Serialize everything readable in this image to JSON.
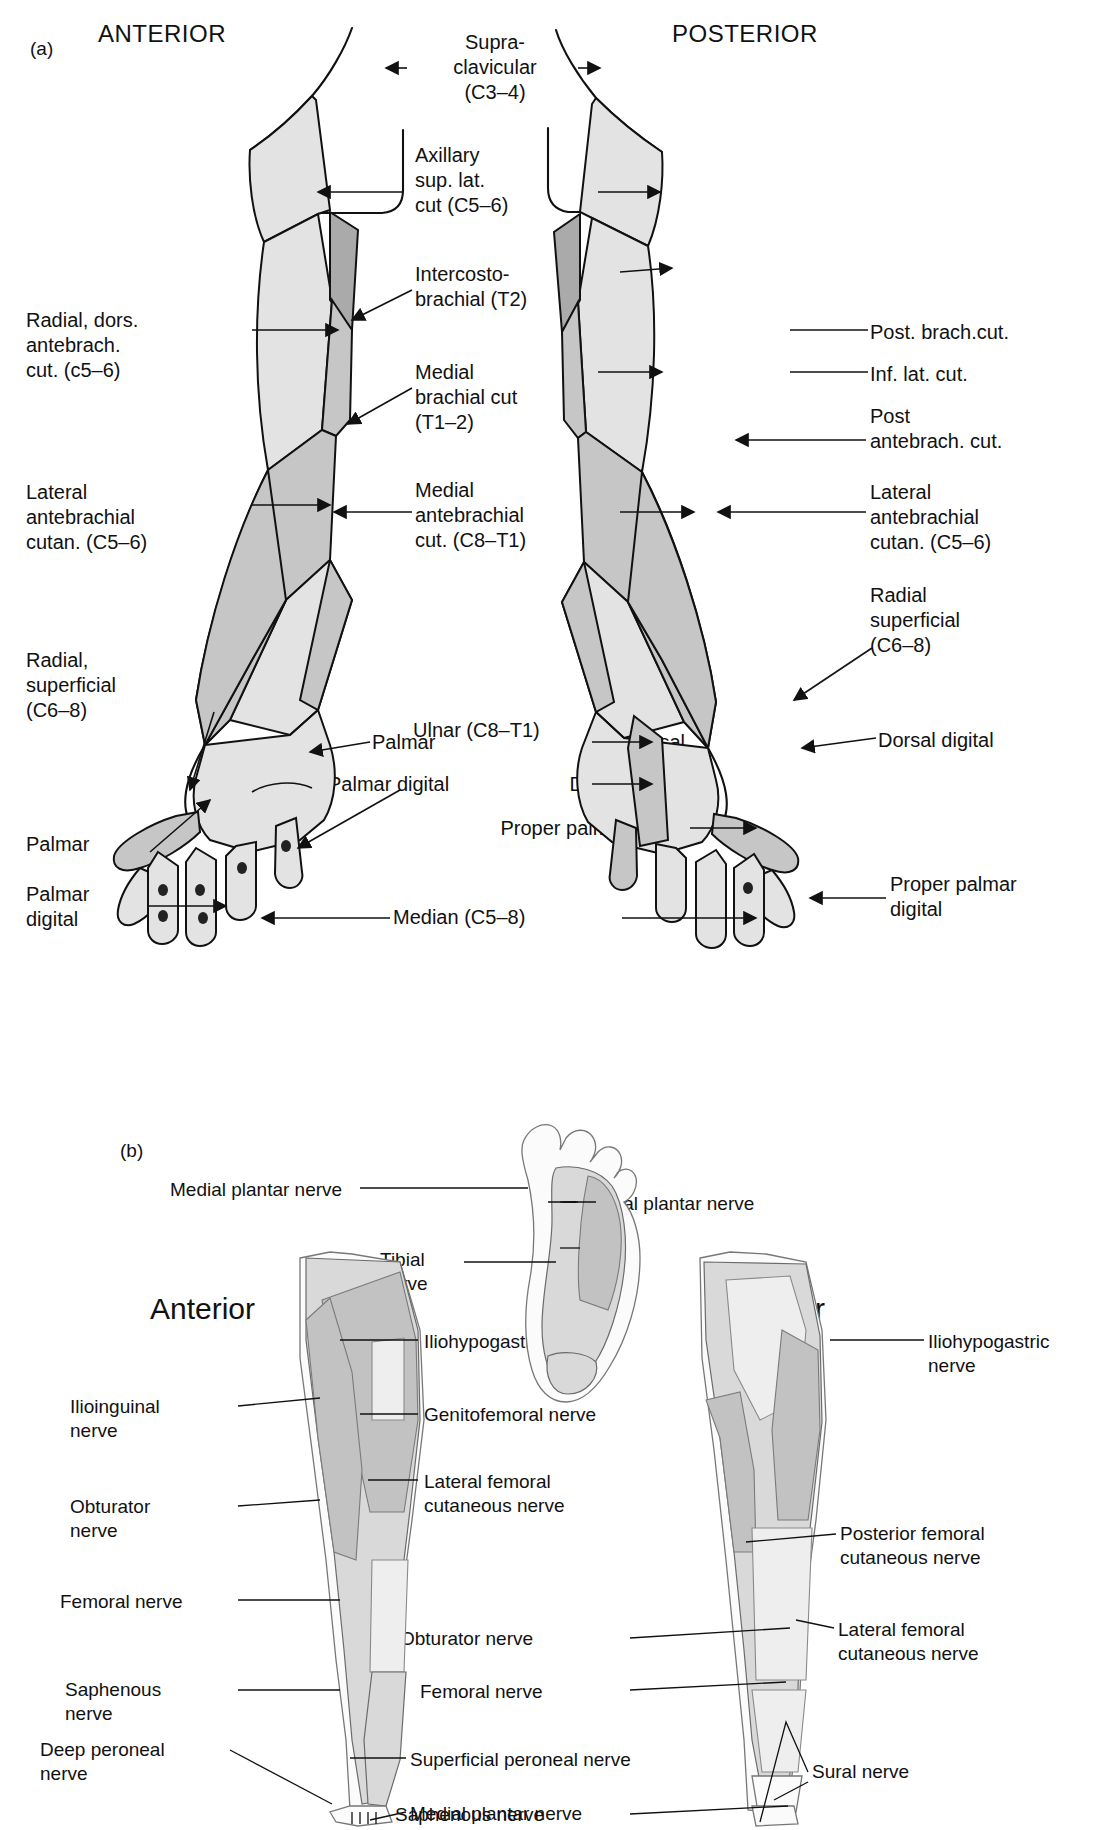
{
  "panel_a": {
    "caption": "(a)",
    "heading_left": "ANTERIOR",
    "heading_right": "POSTERIOR",
    "center_labels": [
      {
        "id": "supraclavicular",
        "text": "Supra-\nclavicular\n(C3–4)"
      },
      {
        "id": "axillary",
        "text": "Axillary\nsup. lat.\ncut (C5–6)"
      },
      {
        "id": "intercostobrachial",
        "text": "Intercosto-\nbrachial (T2)"
      },
      {
        "id": "medial-brachial-cut",
        "text": "Medial\nbrachial cut\n(T1–2)"
      },
      {
        "id": "medial-antebrachial-cut",
        "text": "Medial\nantebrachial\ncut. (C8–T1)"
      },
      {
        "id": "ulnar",
        "text": "Ulnar (C8–T1)"
      },
      {
        "id": "median",
        "text": "Median (C5–8)"
      }
    ],
    "left_labels": [
      {
        "id": "radial-dors-antebrach-cut",
        "text": "Radial, dors.\nantebrach.\ncut. (c5–6)"
      },
      {
        "id": "lateral-antebrachial-cutan",
        "text": "Lateral\nantebrachial\ncutan. (C5–6)"
      },
      {
        "id": "radial-superficial",
        "text": "Radial,\nsuperficial\n(C6–8)"
      },
      {
        "id": "palmar-left",
        "text": "Palmar"
      },
      {
        "id": "palmar-digital-left",
        "text": "Palmar\ndigital"
      }
    ],
    "right_labels": [
      {
        "id": "post-brach-cut",
        "text": "Post. brach.cut."
      },
      {
        "id": "inf-lat-cut",
        "text": "Inf. lat. cut."
      },
      {
        "id": "post-antebrach-cut",
        "text": "Post\nantebrach. cut."
      },
      {
        "id": "lateral-antebrachial-cutan-r",
        "text": "Lateral\nantebrachial\ncutan. (C5–6)"
      },
      {
        "id": "radial-superficial-r",
        "text": "Radial\nsuperficial\n(C6–8)"
      },
      {
        "id": "dorsal-digital-r",
        "text": "Dorsal digital"
      },
      {
        "id": "proper-palmar-digital-r",
        "text": "Proper palmar\ndigital"
      }
    ],
    "hand_labels": [
      {
        "id": "palmar",
        "text": "Palmar"
      },
      {
        "id": "palmar-digital",
        "text": "Palmar digital"
      },
      {
        "id": "dorsal",
        "text": "Dorsal"
      },
      {
        "id": "dorsal-digital",
        "text": "Dorsal digital"
      },
      {
        "id": "proper-palmar-digital",
        "text": "Proper palmar digital"
      }
    ]
  },
  "panel_b": {
    "caption": "(b)",
    "heading_left": "Anterior",
    "heading_right": "Posterior",
    "foot_labels": [
      {
        "id": "medial-plantar-nerve-foot",
        "text": "Medial plantar nerve"
      },
      {
        "id": "lateral-plantar-nerve",
        "text": "Lateral plantar nerve"
      },
      {
        "id": "tibial-nerve-left",
        "text": "Tibial\nnerve"
      },
      {
        "id": "tibial-nerve-right",
        "text": "Tibial\nnerve"
      }
    ],
    "anterior_labels": [
      {
        "id": "iliohypogastric-nerve-a",
        "text": "Iliohypogastric nerve"
      },
      {
        "id": "genitofemoral-nerve",
        "text": "Genitofemoral nerve"
      },
      {
        "id": "lateral-femoral-cutaneous-nerve-a",
        "text": "Lateral femoral\ncutaneous nerve"
      },
      {
        "id": "ilioinguinal-nerve",
        "text": "Ilioinguinal\nnerve"
      },
      {
        "id": "obturator-nerve-a",
        "text": "Obturator\nnerve"
      },
      {
        "id": "femoral-nerve-a",
        "text": "Femoral nerve"
      },
      {
        "id": "saphenous-nerve-a",
        "text": "Saphenous\nnerve"
      },
      {
        "id": "superficial-peroneal-nerve-a",
        "text": "Superficial peroneal nerve"
      },
      {
        "id": "deep-peroneal-nerve",
        "text": "Deep peroneal\nnerve"
      },
      {
        "id": "medial-plantar-nerve-a",
        "text": "Medial plantar nerve"
      }
    ],
    "posterior_labels": [
      {
        "id": "iliohypogastric-nerve-p",
        "text": "Iliohypogastric\nnerve"
      },
      {
        "id": "posterior-femoral-cutaneous-nerve",
        "text": "Posterior femoral\ncutaneous nerve"
      },
      {
        "id": "lateral-femoral-cutaneous-nerve-p",
        "text": "Lateral femoral\ncutaneous nerve"
      },
      {
        "id": "obturator-nerve-p",
        "text": "Obturator nerve"
      },
      {
        "id": "femoral-nerve-p",
        "text": "Femoral nerve"
      },
      {
        "id": "saphenous-nerve-p",
        "text": "Saphenous nerve"
      },
      {
        "id": "sural-nerve",
        "text": "Sural nerve"
      },
      {
        "id": "superficial-peroneal-nerve-p",
        "text": "Superficial peroneal nerve"
      }
    ]
  }
}
